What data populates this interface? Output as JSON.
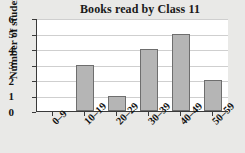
{
  "chart_data": {
    "type": "bar",
    "title": "Books read by Class 11",
    "xlabel": "",
    "ylabel": "Number of students",
    "categories": [
      "0–9",
      "10–19",
      "20–29",
      "30–39",
      "40–49",
      "50–59"
    ],
    "values": [
      0,
      3,
      1,
      4,
      5,
      2
    ],
    "ylim": [
      0,
      6
    ],
    "yticks": [
      0,
      1,
      2,
      3,
      4,
      5,
      6
    ],
    "ytick_labels": [
      "0",
      "1",
      "2",
      "3",
      "4",
      "5",
      "6"
    ],
    "grid": true,
    "legend": false,
    "bar_color": "#b5b5b5",
    "bar_border_color": "#6e6e6e",
    "plot_background": "#ffffff",
    "page_background": "#e9e9e7",
    "axis_color": "#3a3a3a",
    "gridline_color": "#cfcfcf",
    "text_color": "#141414"
  }
}
